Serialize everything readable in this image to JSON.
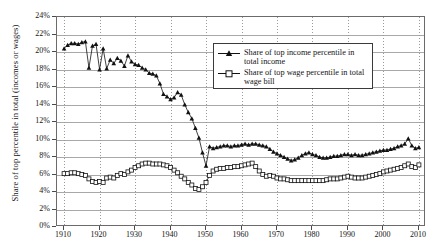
{
  "chart_data": {
    "type": "line",
    "title": "",
    "xlabel": "",
    "ylabel": "Share of top percentile in total (incomes or wages)",
    "xlim": [
      1908,
      2012
    ],
    "ylim": [
      0,
      24
    ],
    "grid": true,
    "y_tick_labels": [
      "24%",
      "22%",
      "20%",
      "18%",
      "16%",
      "14%",
      "12%",
      "10%",
      "8%",
      "6%",
      "4%",
      "2%",
      "0%"
    ],
    "y_tick_values": [
      24,
      22,
      20,
      18,
      16,
      14,
      12,
      10,
      8,
      6,
      4,
      2,
      0
    ],
    "x_tick_labels": [
      "1910",
      "1920",
      "1930",
      "1940",
      "1950",
      "1960",
      "1970",
      "1980",
      "1990",
      "2000",
      "2010"
    ],
    "x_tick_values": [
      1910,
      1920,
      1930,
      1940,
      1950,
      1960,
      1970,
      1980,
      1990,
      2000,
      2010
    ],
    "legend_position": "top-right",
    "series": [
      {
        "name": "Share of top income percentile in total income",
        "marker": "filled-triangle",
        "color": "#111111",
        "x": [
          1910,
          1911,
          1912,
          1913,
          1914,
          1915,
          1916,
          1917,
          1918,
          1919,
          1920,
          1921,
          1922,
          1923,
          1924,
          1925,
          1926,
          1927,
          1928,
          1929,
          1930,
          1931,
          1932,
          1933,
          1934,
          1935,
          1936,
          1937,
          1938,
          1939,
          1940,
          1941,
          1942,
          1943,
          1944,
          1945,
          1946,
          1947,
          1948,
          1949,
          1950,
          1951,
          1952,
          1953,
          1954,
          1955,
          1956,
          1957,
          1958,
          1959,
          1960,
          1961,
          1962,
          1963,
          1964,
          1965,
          1966,
          1967,
          1968,
          1969,
          1970,
          1971,
          1972,
          1973,
          1974,
          1975,
          1976,
          1977,
          1978,
          1979,
          1980,
          1981,
          1982,
          1983,
          1984,
          1985,
          1986,
          1987,
          1988,
          1989,
          1990,
          1991,
          1992,
          1993,
          1994,
          1995,
          1996,
          1997,
          1998,
          1999,
          2000,
          2001,
          2002,
          2003,
          2004,
          2005,
          2006,
          2007,
          2008,
          2009,
          2010
        ],
        "values": [
          20.4,
          20.8,
          21.0,
          21.0,
          20.9,
          21.1,
          21.2,
          18.2,
          20.7,
          20.9,
          18.0,
          20.4,
          18.1,
          19.1,
          18.7,
          19.3,
          19.0,
          18.4,
          19.6,
          18.9,
          18.6,
          18.5,
          18.2,
          18.0,
          17.6,
          17.5,
          17.3,
          16.4,
          15.2,
          14.9,
          14.6,
          14.8,
          15.4,
          15.1,
          14.0,
          13.1,
          12.4,
          11.3,
          10.2,
          8.5,
          7.0,
          9.2,
          9.0,
          9.1,
          9.2,
          9.3,
          9.3,
          9.2,
          9.3,
          9.3,
          9.4,
          9.5,
          9.4,
          9.5,
          9.5,
          9.4,
          9.3,
          9.2,
          8.9,
          8.6,
          8.4,
          8.2,
          8.0,
          7.8,
          7.6,
          7.7,
          7.9,
          8.2,
          8.4,
          8.5,
          8.3,
          8.2,
          8.0,
          7.9,
          7.9,
          8.0,
          8.1,
          8.1,
          8.2,
          8.3,
          8.3,
          8.2,
          8.3,
          8.2,
          8.2,
          8.3,
          8.4,
          8.5,
          8.6,
          8.7,
          8.8,
          8.8,
          8.9,
          9.0,
          9.2,
          9.3,
          9.5,
          10.1,
          9.3,
          9.0,
          9.1
        ]
      },
      {
        "name": "Share of top wage percentile in total wage bill",
        "marker": "open-square",
        "color": "#111111",
        "x": [
          1910,
          1911,
          1912,
          1913,
          1914,
          1915,
          1916,
          1917,
          1918,
          1919,
          1920,
          1921,
          1922,
          1923,
          1924,
          1925,
          1926,
          1927,
          1928,
          1929,
          1930,
          1931,
          1932,
          1933,
          1934,
          1935,
          1936,
          1937,
          1938,
          1939,
          1940,
          1941,
          1942,
          1943,
          1944,
          1945,
          1946,
          1947,
          1948,
          1949,
          1950,
          1951,
          1952,
          1953,
          1954,
          1955,
          1956,
          1957,
          1958,
          1959,
          1960,
          1961,
          1962,
          1963,
          1964,
          1965,
          1966,
          1967,
          1968,
          1969,
          1970,
          1971,
          1972,
          1973,
          1974,
          1975,
          1976,
          1977,
          1978,
          1979,
          1980,
          1981,
          1982,
          1983,
          1984,
          1985,
          1986,
          1987,
          1988,
          1989,
          1990,
          1991,
          1992,
          1993,
          1994,
          1995,
          1996,
          1997,
          1998,
          1999,
          2000,
          2001,
          2002,
          2003,
          2004,
          2005,
          2006,
          2007,
          2008,
          2009,
          2010
        ],
        "values": [
          6.1,
          6.1,
          6.2,
          6.2,
          6.1,
          6.0,
          5.9,
          5.5,
          5.2,
          5.1,
          5.2,
          5.1,
          5.6,
          5.7,
          5.6,
          5.9,
          6.1,
          6.0,
          6.3,
          6.5,
          6.8,
          7.0,
          7.2,
          7.3,
          7.3,
          7.2,
          7.2,
          7.2,
          7.1,
          7.0,
          6.8,
          6.5,
          6.2,
          5.8,
          5.5,
          5.1,
          4.8,
          4.4,
          4.3,
          4.6,
          5.1,
          5.9,
          6.4,
          6.6,
          6.7,
          6.7,
          6.8,
          6.8,
          6.9,
          6.9,
          7.0,
          7.1,
          7.2,
          7.3,
          6.9,
          6.4,
          6.0,
          5.8,
          5.9,
          5.8,
          5.6,
          5.5,
          5.5,
          5.4,
          5.3,
          5.3,
          5.3,
          5.3,
          5.3,
          5.3,
          5.3,
          5.3,
          5.3,
          5.3,
          5.4,
          5.5,
          5.5,
          5.5,
          5.6,
          5.7,
          5.8,
          5.7,
          5.6,
          5.6,
          5.6,
          5.7,
          5.8,
          5.9,
          6.0,
          6.1,
          6.3,
          6.4,
          6.5,
          6.6,
          6.7,
          6.8,
          7.0,
          7.2,
          6.9,
          6.8,
          7.1
        ]
      }
    ]
  }
}
